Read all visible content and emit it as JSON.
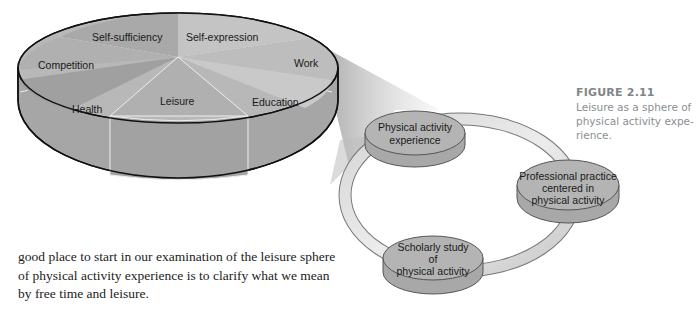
{
  "figure": {
    "number": "FIGURE 2.11",
    "caption_lines": [
      "Leisure as a sphere of",
      "physical activity expe-",
      "rience."
    ]
  },
  "pie": {
    "slices": [
      {
        "label": "Self-sufficiency"
      },
      {
        "label": "Self-expression"
      },
      {
        "label": "Work"
      },
      {
        "label": "Competition"
      },
      {
        "label": "Education"
      },
      {
        "label": "Health"
      },
      {
        "label": "Leisure"
      }
    ]
  },
  "cycle": {
    "nodes": [
      {
        "lines": [
          "Physical activity",
          "experience"
        ]
      },
      {
        "lines": [
          "Professional practice",
          "centered in",
          "physical activity"
        ]
      },
      {
        "lines": [
          "Scholarly study",
          "of",
          "physical activity"
        ]
      }
    ]
  },
  "body": {
    "lines": [
      "good place to start in our examination of the leisure sphere",
      "of physical activity experience is to clarify what we mean",
      "by free time and leisure."
    ]
  },
  "colors": {
    "pie_top": "#b5b5b5",
    "pie_side": "#a3a3a3",
    "outline": "#111111",
    "caption": "#8a8f93"
  }
}
